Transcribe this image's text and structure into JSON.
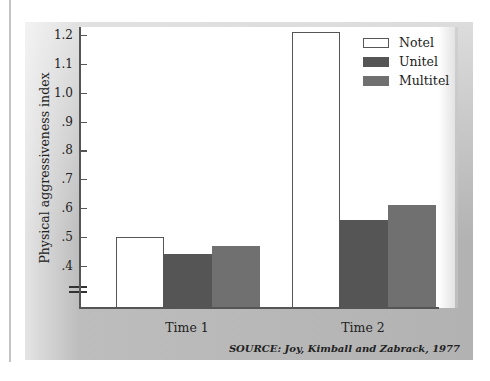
{
  "chart_data": {
    "type": "bar",
    "title": "",
    "xlabel": "",
    "ylabel": "Physical aggressiveness index",
    "categories": [
      "Time 1",
      "Time 2"
    ],
    "series": [
      {
        "name": "Notel",
        "color": "#ffffff",
        "values": [
          0.5,
          1.21
        ]
      },
      {
        "name": "Unitel",
        "color": "#555555",
        "values": [
          0.44,
          0.56
        ]
      },
      {
        "name": "Multitel",
        "color": "#707070",
        "values": [
          0.47,
          0.61
        ]
      }
    ],
    "y_ticks": [
      "1.2",
      "1.1",
      "1.0",
      ".9",
      ".8",
      ".7",
      ".6",
      ".5",
      ".4"
    ],
    "ylim": [
      0.3,
      1.2
    ],
    "axis_break": true,
    "grid": false,
    "legend_position": "top-right",
    "source": "SOURCE: Joy, Kimball and Zabrack, 1977"
  },
  "legend": [
    {
      "label": "Notel"
    },
    {
      "label": "Unitel"
    },
    {
      "label": "Multitel"
    }
  ],
  "x_labels": [
    "Time 1",
    "Time 2"
  ]
}
